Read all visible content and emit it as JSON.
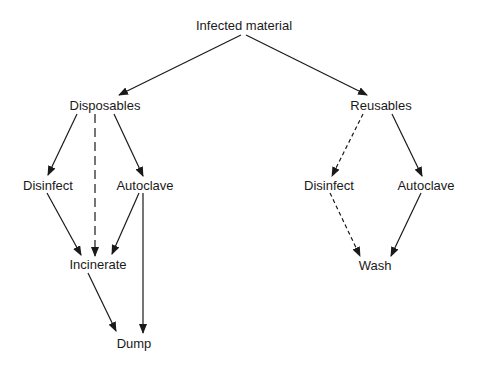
{
  "diagram": {
    "nodes": {
      "root": {
        "label": "Infected material",
        "x": 244,
        "y": 25
      },
      "disposables": {
        "label": "Disposables",
        "x": 105,
        "y": 105
      },
      "reusables": {
        "label": "Reusables",
        "x": 381,
        "y": 105
      },
      "disp_disinfect": {
        "label": "Disinfect",
        "x": 48,
        "y": 185
      },
      "disp_autoclave": {
        "label": "Autoclave",
        "x": 145,
        "y": 185
      },
      "incinerate": {
        "label": "Incinerate",
        "x": 98,
        "y": 265
      },
      "dump": {
        "label": "Dump",
        "x": 134,
        "y": 345
      },
      "reus_disinfect": {
        "label": "Disinfect",
        "x": 329,
        "y": 185
      },
      "reus_autoclave": {
        "label": "Autoclave",
        "x": 393,
        "y": 185
      },
      "wash": {
        "label": "Wash",
        "x": 375,
        "y": 265
      }
    },
    "edges": [
      {
        "from": "root",
        "to": "disposables",
        "style": "solid"
      },
      {
        "from": "root",
        "to": "reusables",
        "style": "solid"
      },
      {
        "from": "disposables",
        "to": "disp_disinfect",
        "style": "solid"
      },
      {
        "from": "disposables",
        "to": "incinerate",
        "style": "long-dash"
      },
      {
        "from": "disposables",
        "to": "disp_autoclave",
        "style": "solid"
      },
      {
        "from": "disp_disinfect",
        "to": "incinerate",
        "style": "solid"
      },
      {
        "from": "disp_autoclave",
        "to": "incinerate",
        "style": "solid"
      },
      {
        "from": "disp_autoclave",
        "to": "dump",
        "style": "solid"
      },
      {
        "from": "incinerate",
        "to": "dump",
        "style": "solid"
      },
      {
        "from": "reusables",
        "to": "reus_disinfect",
        "style": "short-dash"
      },
      {
        "from": "reusables",
        "to": "reus_autoclave",
        "style": "solid"
      },
      {
        "from": "reus_disinfect",
        "to": "wash",
        "style": "short-dash"
      },
      {
        "from": "reus_autoclave",
        "to": "wash",
        "style": "solid"
      }
    ]
  }
}
